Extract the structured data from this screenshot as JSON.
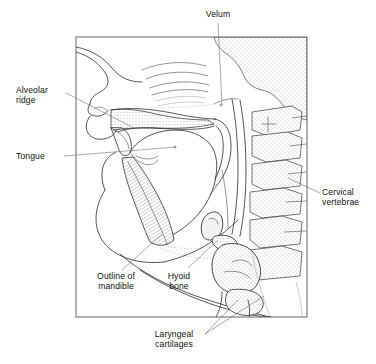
{
  "figure": {
    "kind": "anatomical-line-drawing",
    "background_color": "#ffffff",
    "line_color": "#2b2b2b",
    "leader_color": "#6e6e6e",
    "frame": {
      "x": 76,
      "y": 37,
      "width": 231,
      "height": 280,
      "color": "#555555"
    }
  },
  "labels": [
    {
      "id": "velum",
      "text": "Velum",
      "x": 190,
      "y": 10,
      "width": 56,
      "align": "center",
      "leader": "M 218 23 L 222 105"
    },
    {
      "id": "alveolar-ridge",
      "text": "Alveolar\nridge",
      "x": 16,
      "y": 86,
      "width": 56,
      "align": "left",
      "leader": "M 66 93 L 134 128"
    },
    {
      "id": "tongue",
      "text": "Tongue",
      "x": 16,
      "y": 152,
      "width": 56,
      "align": "left",
      "leader": "M 64 156 L 157 153"
    },
    {
      "id": "cervical-vertebrae",
      "text": "Cervical\nvertebrae",
      "x": 322,
      "y": 188,
      "width": 54,
      "align": "left",
      "leader": "M 320 193 L 288 178"
    },
    {
      "id": "outline-of-mandible",
      "text": "Outline of\nmandible",
      "x": 88,
      "y": 272,
      "width": 56,
      "align": "center",
      "leader": "M 122 270 L 160 236"
    },
    {
      "id": "hyoid-bone",
      "text": "Hyoid\nbone",
      "x": 158,
      "y": 272,
      "width": 42,
      "align": "center",
      "leader": "M 186 270 L 214 239"
    },
    {
      "id": "laryngeal-cartilages",
      "text": "Laryngeal\ncartilages",
      "x": 143,
      "y": 330,
      "width": 64,
      "align": "center",
      "leader": "M 205 334 L 262 298"
    }
  ],
  "structures": [
    {
      "name": "nasal-cavity",
      "label": "Nasal cavity"
    },
    {
      "name": "hard-palate",
      "label": "Hard palate"
    },
    {
      "name": "soft-palate-velum",
      "label": "Velum (soft palate)"
    },
    {
      "name": "alveolar-ridge",
      "label": "Alveolar ridge"
    },
    {
      "name": "tongue-body",
      "label": "Tongue"
    },
    {
      "name": "mandible",
      "label": "Mandible"
    },
    {
      "name": "hyoid-bone",
      "label": "Hyoid bone"
    },
    {
      "name": "epiglottis",
      "label": "Epiglottis"
    },
    {
      "name": "laryngeal-cartilages",
      "label": "Laryngeal cartilages"
    },
    {
      "name": "cervical-vertebrae",
      "label": "Cervical vertebrae"
    },
    {
      "name": "pharyngeal-wall",
      "label": "Pharyngeal wall"
    },
    {
      "name": "lips",
      "label": "Lips"
    }
  ]
}
